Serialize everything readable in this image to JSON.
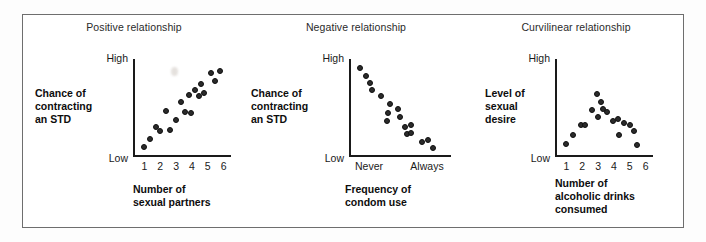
{
  "figure": {
    "frame_color": "#6e6e6e",
    "dot_color": "#2b2b2b",
    "axis_color": "#1a1a1a"
  },
  "chart_data": [
    {
      "type": "scatter",
      "title": "Positive relationship",
      "xlabel": "Number of\nsexual partners",
      "xlabel_lines": [
        "Number of",
        "sexual partners"
      ],
      "ylabel_lines": [
        "Chance of",
        "contracting",
        "an STD"
      ],
      "ytick_labels": [
        "High",
        "Low"
      ],
      "xtick_labels": [
        "1",
        "2",
        "3",
        "4",
        "5",
        "6"
      ],
      "xlim": [
        0.6,
        6.4
      ],
      "ylim": [
        0,
        10
      ],
      "grid": false,
      "legend": "none",
      "points": [
        {
          "x": 1.0,
          "y": 0.6
        },
        {
          "x": 1.35,
          "y": 1.5
        },
        {
          "x": 1.75,
          "y": 2.8
        },
        {
          "x": 2.0,
          "y": 2.3
        },
        {
          "x": 2.35,
          "y": 4.6
        },
        {
          "x": 2.6,
          "y": 2.5
        },
        {
          "x": 3.0,
          "y": 3.6
        },
        {
          "x": 3.3,
          "y": 5.6
        },
        {
          "x": 3.55,
          "y": 4.4
        },
        {
          "x": 3.8,
          "y": 6.3
        },
        {
          "x": 3.95,
          "y": 4.3
        },
        {
          "x": 4.2,
          "y": 6.9
        },
        {
          "x": 4.45,
          "y": 6.2
        },
        {
          "x": 4.55,
          "y": 7.6
        },
        {
          "x": 4.75,
          "y": 6.6
        },
        {
          "x": 5.2,
          "y": 8.8
        },
        {
          "x": 5.45,
          "y": 7.9
        },
        {
          "x": 5.75,
          "y": 9.0
        }
      ]
    },
    {
      "type": "scatter",
      "title": "Negative relationship",
      "xlabel": "Frequency of\ncondom use",
      "xlabel_lines": [
        "Frequency of",
        "condom use"
      ],
      "ylabel_lines": [
        "Chance of",
        "contracting",
        "an STD"
      ],
      "ytick_labels": [
        "High",
        "Low"
      ],
      "xtick_labels": [
        "Never",
        "Always"
      ],
      "xlim": [
        0,
        10
      ],
      "ylim": [
        0,
        10
      ],
      "grid": false,
      "legend": "none",
      "points": [
        {
          "x": 0.6,
          "y": 9.3
        },
        {
          "x": 1.25,
          "y": 8.5
        },
        {
          "x": 1.7,
          "y": 7.7
        },
        {
          "x": 1.85,
          "y": 6.9
        },
        {
          "x": 2.8,
          "y": 6.2
        },
        {
          "x": 3.7,
          "y": 5.3
        },
        {
          "x": 3.5,
          "y": 4.3
        },
        {
          "x": 3.45,
          "y": 3.5
        },
        {
          "x": 4.6,
          "y": 4.8
        },
        {
          "x": 4.75,
          "y": 3.9
        },
        {
          "x": 5.3,
          "y": 2.8
        },
        {
          "x": 5.9,
          "y": 3.0
        },
        {
          "x": 5.55,
          "y": 2.0
        },
        {
          "x": 5.95,
          "y": 2.1
        },
        {
          "x": 7.1,
          "y": 1.1
        },
        {
          "x": 7.7,
          "y": 1.3
        },
        {
          "x": 8.2,
          "y": 0.5
        }
      ]
    },
    {
      "type": "scatter",
      "title": "Curvilinear relationship",
      "xlabel": "Number of\nalcoholic drinks\nconsumed",
      "xlabel_lines": [
        "Number of",
        "alcoholic drinks",
        "consumed"
      ],
      "ylabel_lines": [
        "Level of",
        "sexual",
        "desire"
      ],
      "ytick_labels": [
        "High",
        "Low"
      ],
      "xtick_labels": [
        "1",
        "2",
        "3",
        "4",
        "5",
        "6"
      ],
      "xlim": [
        0.6,
        6.4
      ],
      "ylim": [
        0,
        10
      ],
      "grid": false,
      "legend": "none",
      "points": [
        {
          "x": 1.0,
          "y": 0.9
        },
        {
          "x": 1.45,
          "y": 1.9
        },
        {
          "x": 1.9,
          "y": 3.0
        },
        {
          "x": 2.2,
          "y": 3.0
        },
        {
          "x": 2.6,
          "y": 4.7
        },
        {
          "x": 2.95,
          "y": 6.5
        },
        {
          "x": 3.0,
          "y": 3.9
        },
        {
          "x": 3.2,
          "y": 5.6
        },
        {
          "x": 3.3,
          "y": 4.8
        },
        {
          "x": 3.55,
          "y": 4.5
        },
        {
          "x": 3.95,
          "y": 3.4
        },
        {
          "x": 4.25,
          "y": 3.7
        },
        {
          "x": 4.35,
          "y": 1.9
        },
        {
          "x": 4.65,
          "y": 3.2
        },
        {
          "x": 5.0,
          "y": 3.0
        },
        {
          "x": 5.25,
          "y": 2.3
        },
        {
          "x": 5.45,
          "y": 0.8
        }
      ]
    }
  ]
}
